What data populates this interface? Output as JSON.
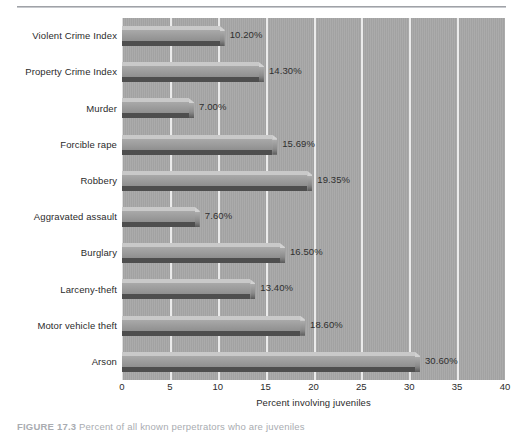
{
  "figure": {
    "caption_number": "FIGURE 17.3",
    "caption_text": "Percent of all known perpetrators who are juveniles"
  },
  "chart_data": {
    "type": "bar",
    "orientation": "horizontal",
    "title": "",
    "subtitle": "",
    "xlabel": "Percent involving juveniles",
    "ylabel": "",
    "categories": [
      "Violent Crime Index",
      "Property Crime Index",
      "Murder",
      "Forcible rape",
      "Robbery",
      "Aggravated assault",
      "Burglary",
      "Larceny-theft",
      "Motor vehicle theft",
      "Arson"
    ],
    "values": [
      10.2,
      14.3,
      7.0,
      15.69,
      19.35,
      7.6,
      16.5,
      13.4,
      18.6,
      30.6
    ],
    "value_labels": [
      "10.20%",
      "14.30%",
      "7.00%",
      "15.69%",
      "19.35%",
      "7.60%",
      "16.50%",
      "13.40%",
      "18.60%",
      "30.60%"
    ],
    "xlim": [
      0,
      40
    ],
    "xticks": [
      0,
      5,
      10,
      15,
      20,
      25,
      30,
      35,
      40
    ],
    "xtick_labels": [
      "0",
      "5",
      "10",
      "15",
      "20",
      "25",
      "30",
      "35",
      "40"
    ],
    "grid": "vertical",
    "legend": "none"
  },
  "colors": {
    "plot_background": "#9d9d9d",
    "gridline": "#e9e9e9",
    "bar_face": "#9b9b9b",
    "bar_top": "#c9c9c9",
    "bar_shadow": "#4e4e4e",
    "text": "#2b2b2b",
    "page_background": "#ffffff",
    "rule": "#8e9095"
  }
}
